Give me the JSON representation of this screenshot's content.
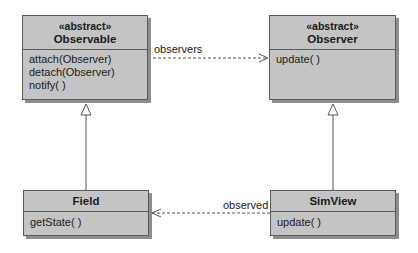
{
  "diagram": {
    "type": "uml-class-diagram",
    "classes": [
      {
        "id": "observable",
        "stereotype": "«abstract»",
        "name": "Observable",
        "operations": [
          "attach(Observer)",
          "detach(Observer)",
          "notify( )"
        ]
      },
      {
        "id": "observer",
        "stereotype": "«abstract»",
        "name": "Observer",
        "operations": [
          "update( )"
        ]
      },
      {
        "id": "field",
        "name": "Field",
        "operations": [
          "getState( )"
        ]
      },
      {
        "id": "simview",
        "name": "SimView",
        "operations": [
          "update( )"
        ]
      }
    ],
    "relations": [
      {
        "from": "Observable",
        "to": "Observer",
        "kind": "dependency",
        "label": "observers"
      },
      {
        "from": "SimView",
        "to": "Field",
        "kind": "dependency",
        "label": "observed"
      },
      {
        "from": "Field",
        "to": "Observable",
        "kind": "generalization"
      },
      {
        "from": "SimView",
        "to": "Observer",
        "kind": "generalization"
      }
    ]
  },
  "colors": {
    "box_fill": "#c4c4c4",
    "box_border": "#5a5a5a",
    "shadow": "#8e8e8e",
    "line": "#555555"
  }
}
